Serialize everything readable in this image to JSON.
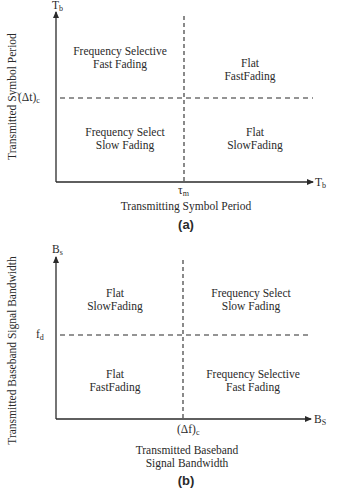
{
  "panels": {
    "a": {
      "tag": "(a)",
      "y_axis": {
        "symbol": "T",
        "symbol_sub": "b",
        "title": "Transmitted Symbol Period",
        "threshold": "(Δt)",
        "threshold_sub": "c"
      },
      "x_axis": {
        "symbol": "T",
        "symbol_sub": "b",
        "title": "Transmitting Symbol Period",
        "threshold": "τ",
        "threshold_sub": "m"
      },
      "regions": {
        "top_left": {
          "line1": "Frequency Selective",
          "line2": "Fast Fading"
        },
        "top_right": {
          "line1": "Flat",
          "line2": "FastFading"
        },
        "bottom_left": {
          "line1": "Frequency Select",
          "line2": "Slow Fading"
        },
        "bottom_right": {
          "line1": "Flat",
          "line2": "SlowFading"
        }
      }
    },
    "b": {
      "tag": "(b)",
      "y_axis": {
        "symbol": "B",
        "symbol_sub": "s",
        "title": "Transmitted Baseband Signal Bandwidth",
        "threshold": "f",
        "threshold_sub": "d"
      },
      "x_axis": {
        "symbol": "B",
        "symbol_sub": "S",
        "title_line1": "Transmitted Baseband",
        "title_line2": "Signal Bandwidth",
        "threshold": "(Δf)",
        "threshold_sub": "c"
      },
      "regions": {
        "top_left": {
          "line1": "Flat",
          "line2": "SlowFading"
        },
        "top_right": {
          "line1": "Frequency Select",
          "line2": "Slow Fading"
        },
        "bottom_left": {
          "line1": "Flat",
          "line2": "FastFading"
        },
        "bottom_right": {
          "line1": "Frequency Selective",
          "line2": "Fast Fading"
        }
      }
    }
  },
  "colors": {
    "ink": "#2a2a2a",
    "background": "#ffffff"
  }
}
